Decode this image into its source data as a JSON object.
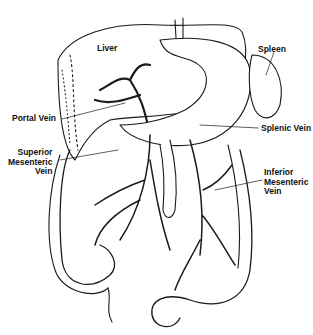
{
  "diagram": {
    "type": "anatomical illustration",
    "colors": {
      "ink": "#1a1a1a",
      "background": "#ffffff"
    },
    "labels": {
      "liver": {
        "text": "Liver",
        "x": 97,
        "y": 44
      },
      "spleen": {
        "text": "Spleen",
        "x": 262,
        "y": 45
      },
      "portal_vein": {
        "text": "Portal Vein",
        "x": 16,
        "y": 117
      },
      "splenic_vein": {
        "text": "Splenic Vein",
        "x": 261,
        "y": 124
      },
      "superior_mesenteric_vein": {
        "lines": [
          "Superior",
          "Mesenteric",
          "Vein"
        ],
        "x": 14,
        "y": 150
      },
      "inferior_mesenteric_vein": {
        "lines": [
          "Inferior",
          "Mesenteric",
          "Vein"
        ],
        "x": 264,
        "y": 168
      }
    }
  }
}
